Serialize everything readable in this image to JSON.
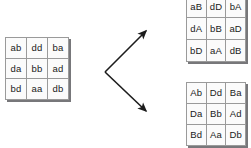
{
  "diagram": {
    "line_color": "#1c1c1c",
    "cell_border_color": "#9a9a9a",
    "cell_fill_color": "#fbfbfb",
    "shadow_color": "#77777a",
    "background_color": "#ffffff"
  },
  "source_grid": {
    "name": "source-matrix",
    "rows": 3,
    "cols": 3,
    "cells": [
      [
        "ab",
        "dd",
        "ba"
      ],
      [
        "da",
        "bb",
        "ad"
      ],
      [
        "bd",
        "aa",
        "db"
      ]
    ]
  },
  "upper_grid": {
    "name": "upper-result-matrix",
    "rows": 3,
    "cols": 3,
    "cells": [
      [
        "aB",
        "dD",
        "bA"
      ],
      [
        "dA",
        "bB",
        "aD"
      ],
      [
        "bD",
        "aA",
        "dB"
      ]
    ]
  },
  "lower_grid": {
    "name": "lower-result-matrix",
    "rows": 3,
    "cols": 3,
    "cells": [
      [
        "Ab",
        "Dd",
        "Ba"
      ],
      [
        "Da",
        "Bb",
        "Ad"
      ],
      [
        "Bd",
        "Aa",
        "Db"
      ]
    ]
  },
  "arrow": {
    "name": "branching-arrow",
    "vertex": [
      7,
      52
    ],
    "upper_tip": [
      50,
      10
    ],
    "lower_tip": [
      50,
      92
    ],
    "direction": "branches-right"
  }
}
